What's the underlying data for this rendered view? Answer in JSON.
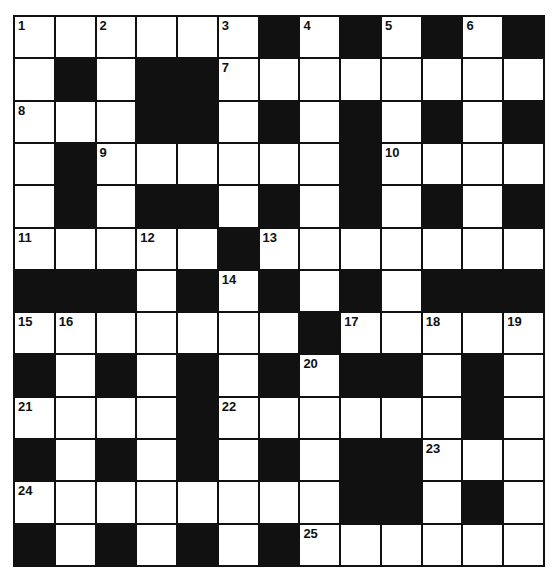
{
  "puzzle": {
    "rows": 13,
    "cols": 13,
    "colors": {
      "block": "#111111",
      "white": "#ffffff",
      "line": "#111111"
    },
    "layout": [
      "WWWWWWBWBWBWB",
      "WBWBBWWWWWWWW",
      "WWWBBWBWBWBWB",
      "WBWWWWWWBWWWW",
      "WBWBBWBWBWBWB",
      "WWWWWBWWWWWWW",
      "BBBWBWBWBWBBB",
      "WWWWWWWBWWWWW",
      "BWBWBWBWBBWBW",
      "WWWWBWWWWWWBW",
      "BWBWBWBWBBWWW",
      "WWWWWWWWBBWBW",
      "BWBWBWBWWWWWW"
    ],
    "numbers": [
      {
        "r": 0,
        "c": 0,
        "n": "1"
      },
      {
        "r": 0,
        "c": 2,
        "n": "2"
      },
      {
        "r": 0,
        "c": 5,
        "n": "3"
      },
      {
        "r": 0,
        "c": 7,
        "n": "4"
      },
      {
        "r": 0,
        "c": 9,
        "n": "5"
      },
      {
        "r": 0,
        "c": 11,
        "n": "6"
      },
      {
        "r": 1,
        "c": 5,
        "n": "7"
      },
      {
        "r": 2,
        "c": 0,
        "n": "8"
      },
      {
        "r": 3,
        "c": 2,
        "n": "9"
      },
      {
        "r": 3,
        "c": 9,
        "n": "10"
      },
      {
        "r": 5,
        "c": 0,
        "n": "11"
      },
      {
        "r": 5,
        "c": 3,
        "n": "12"
      },
      {
        "r": 5,
        "c": 6,
        "n": "13"
      },
      {
        "r": 6,
        "c": 5,
        "n": "14"
      },
      {
        "r": 7,
        "c": 0,
        "n": "15"
      },
      {
        "r": 7,
        "c": 1,
        "n": "16"
      },
      {
        "r": 7,
        "c": 8,
        "n": "17"
      },
      {
        "r": 7,
        "c": 10,
        "n": "18"
      },
      {
        "r": 7,
        "c": 12,
        "n": "19"
      },
      {
        "r": 8,
        "c": 7,
        "n": "20"
      },
      {
        "r": 9,
        "c": 0,
        "n": "21"
      },
      {
        "r": 9,
        "c": 5,
        "n": "22"
      },
      {
        "r": 10,
        "c": 10,
        "n": "23"
      },
      {
        "r": 11,
        "c": 0,
        "n": "24"
      },
      {
        "r": 12,
        "c": 7,
        "n": "25"
      }
    ]
  }
}
